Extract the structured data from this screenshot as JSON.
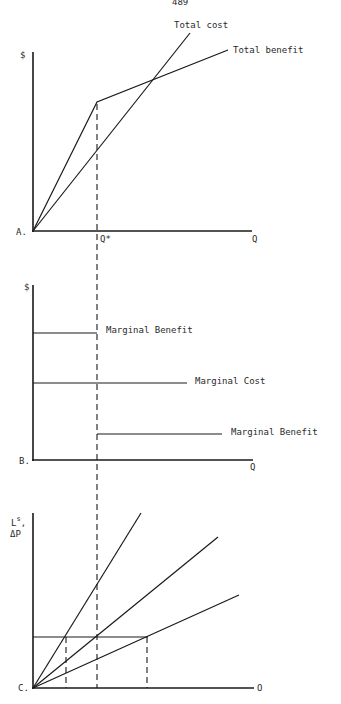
{
  "page_number": "489",
  "panels": {
    "a": {
      "id_label": "A.",
      "y_label": "$",
      "x_label": "Q",
      "qstar_label": "Q*",
      "curves": {
        "total_cost": "Total cost",
        "total_benefit": "Total benefit"
      }
    },
    "b": {
      "id_label": "B.",
      "y_label": "$",
      "x_label": "Q",
      "curves": {
        "marginal_benefit_high": "Marginal Benefit",
        "marginal_cost": "Marginal Cost",
        "marginal_benefit_low": "Marginal Benefit"
      }
    },
    "c": {
      "id_label": "C.",
      "y_label_top": "L",
      "y_label_sup": "s",
      "y_label_comma": ",",
      "y_label_bottom": "ΔP",
      "x_label": "O"
    }
  },
  "colors": {
    "ink": "#1a1a1a",
    "paper": "#ffffff"
  }
}
